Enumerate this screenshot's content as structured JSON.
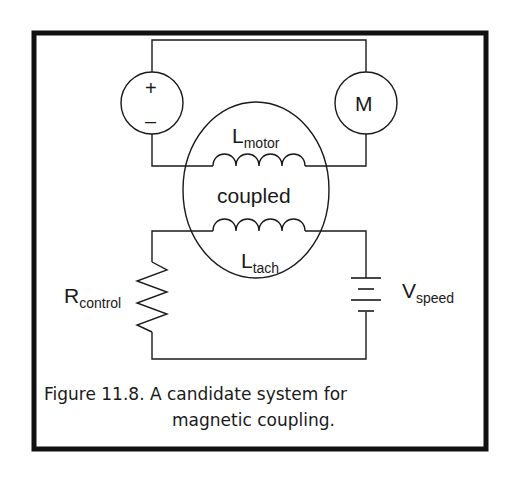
{
  "figure": {
    "source_symbol": {
      "plus": "+",
      "minus": "–"
    },
    "motor_label": "M",
    "coupling_label": "coupled",
    "inductor_motor": {
      "main": "L",
      "sub": "motor"
    },
    "inductor_tach": {
      "main": "L",
      "sub": "tach"
    },
    "resistor": {
      "main": "R",
      "sub": "control"
    },
    "battery": {
      "main": "V",
      "sub": "speed"
    },
    "caption": {
      "line1": "Figure 11.8.  A candidate system for",
      "line2": "magnetic coupling."
    },
    "colors": {
      "line": "#1a1a1a",
      "frame": "#111111",
      "background": "#ffffff"
    }
  }
}
